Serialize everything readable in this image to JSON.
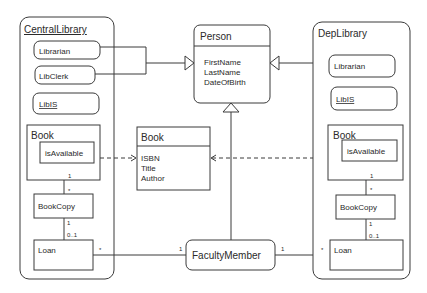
{
  "diagram": {
    "type": "UML class diagram",
    "central_library": {
      "title": "CentralLibrary",
      "librarian": "Librarian",
      "libclerk": "LibClerk",
      "libis": "LibIS",
      "book": {
        "title": "Book",
        "attr": "isAvailable"
      },
      "bookcopy": "BookCopy",
      "loan": "Loan",
      "mult_book_bookcopy_top": "1",
      "mult_book_bookcopy_bottom": "*",
      "mult_bookcopy_loan_top": "1",
      "mult_bookcopy_loan_bottom": "0..1",
      "mult_loan_faculty": "*"
    },
    "dep_library": {
      "title": "DepLibrary",
      "librarian": "Librarian",
      "libis": "LibIS",
      "book": {
        "title": "Book",
        "attr": "isAvailable"
      },
      "bookcopy": "BookCopy",
      "loan": "Loan",
      "mult_book_bookcopy_top": "1",
      "mult_book_bookcopy_bottom": "*",
      "mult_bookcopy_loan_top": "1",
      "mult_bookcopy_loan_bottom": "0..1",
      "mult_loan_faculty": "*"
    },
    "person": {
      "title": "Person",
      "attributes": [
        "FirstName",
        "LastName",
        "DateOfBirth"
      ]
    },
    "book": {
      "title": "Book",
      "attributes": [
        "ISBN",
        "Title",
        "Author"
      ]
    },
    "faculty_member": {
      "title": "FacultyMember",
      "mult_left": "1",
      "mult_right": "1"
    },
    "colors": {
      "stroke": "#3a3a3a",
      "text": "#2a2a2a",
      "background": "#ffffff"
    }
  }
}
